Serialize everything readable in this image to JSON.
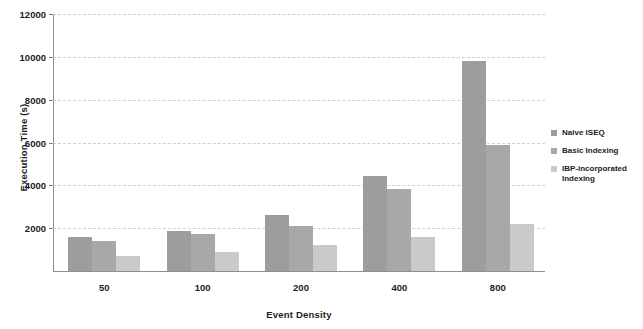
{
  "chart_data": {
    "type": "bar",
    "title": "",
    "xlabel": "Event Density",
    "ylabel": "Execution Time (s)",
    "categories": [
      "50",
      "100",
      "200",
      "400",
      "800"
    ],
    "ylim": [
      0,
      12000
    ],
    "yticks": [
      2000,
      4000,
      6000,
      8000,
      10000,
      12000
    ],
    "ytick_labels": [
      "2000",
      "4000",
      "6000",
      "8000",
      "10000",
      "12000"
    ],
    "grid": true,
    "legend_position": "right",
    "series": [
      {
        "name": "Naive ISEQ",
        "color": "#9d9d9d",
        "values": [
          1570,
          1880,
          2620,
          4450,
          9800
        ]
      },
      {
        "name": "Basic Indexing",
        "color": "#a8a8a8",
        "values": [
          1400,
          1720,
          2120,
          3850,
          5900
        ]
      },
      {
        "name": "IBP-incorporated Indexing",
        "color": "#cacaca",
        "values": [
          700,
          870,
          1200,
          1600,
          2200
        ]
      }
    ]
  },
  "legend": {
    "items": [
      {
        "label": "Naive ISEQ"
      },
      {
        "label": "Basic Indexing"
      },
      {
        "label": "IBP-incorporated Indexing"
      }
    ]
  }
}
